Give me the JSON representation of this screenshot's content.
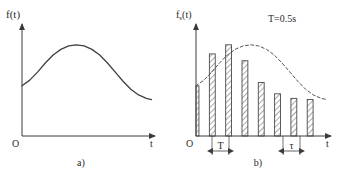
{
  "figure": {
    "background": "#ffffff",
    "stroke": "#3a3a3a",
    "hatch_color": "#555555"
  },
  "panel_a": {
    "caption": "a)",
    "y_axis_label": "f(t)",
    "x_axis_label": "t",
    "origin_label": "O",
    "axes": {
      "x0": 22,
      "y0": 136,
      "x1": 158,
      "y1": 22
    },
    "chart_data": {
      "type": "line",
      "title": "",
      "xlabel": "t",
      "ylabel": "f(t)",
      "series": [
        {
          "name": "f(t)",
          "points": [
            [
              0.0,
              0.44
            ],
            [
              0.06,
              0.49
            ],
            [
              0.12,
              0.56
            ],
            [
              0.18,
              0.64
            ],
            [
              0.24,
              0.71
            ],
            [
              0.3,
              0.76
            ],
            [
              0.36,
              0.79
            ],
            [
              0.42,
              0.8
            ],
            [
              0.48,
              0.79
            ],
            [
              0.54,
              0.76
            ],
            [
              0.6,
              0.71
            ],
            [
              0.66,
              0.64
            ],
            [
              0.72,
              0.56
            ],
            [
              0.78,
              0.48
            ],
            [
              0.84,
              0.41
            ],
            [
              0.9,
              0.36
            ],
            [
              0.96,
              0.33
            ],
            [
              1.0,
              0.32
            ]
          ]
        }
      ],
      "xlim": [
        0,
        1.05
      ],
      "ylim": [
        0,
        1
      ],
      "grid": false,
      "legend": "none"
    }
  },
  "panel_b": {
    "caption": "b)",
    "y_axis_label": "fs(t)",
    "x_axis_label": "t",
    "origin_label": "O",
    "annotation": "T=0.5s",
    "period_label": "T",
    "width_label": "τ",
    "axes": {
      "x0": 196,
      "y0": 136,
      "x1": 333,
      "y1": 22
    },
    "chart_data": {
      "type": "bar",
      "title": "",
      "xlabel": "t",
      "ylabel": "fs(t)",
      "annotation": "T=0.5s",
      "period": 0.5,
      "period_unit": "s",
      "categories": [
        "0",
        "T",
        "2T",
        "3T",
        "4T",
        "5T",
        "6T",
        "7T"
      ],
      "x": [
        0.0,
        0.125,
        0.25,
        0.375,
        0.5,
        0.625,
        0.75,
        0.875
      ],
      "values": [
        0.44,
        0.72,
        0.8,
        0.66,
        0.47,
        0.37,
        0.33,
        0.32
      ],
      "bar_width": 0.045,
      "xlim": [
        0,
        1.05
      ],
      "ylim": [
        0,
        1
      ],
      "grid": false,
      "legend": "none",
      "envelope": {
        "name": "f(t) envelope",
        "style": "dashed",
        "points": [
          [
            0.0,
            0.44
          ],
          [
            0.06,
            0.49
          ],
          [
            0.12,
            0.56
          ],
          [
            0.18,
            0.64
          ],
          [
            0.24,
            0.71
          ],
          [
            0.3,
            0.76
          ],
          [
            0.36,
            0.79
          ],
          [
            0.42,
            0.8
          ],
          [
            0.48,
            0.79
          ],
          [
            0.54,
            0.76
          ],
          [
            0.6,
            0.71
          ],
          [
            0.66,
            0.64
          ],
          [
            0.72,
            0.56
          ],
          [
            0.78,
            0.48
          ],
          [
            0.84,
            0.41
          ],
          [
            0.9,
            0.36
          ],
          [
            0.96,
            0.33
          ],
          [
            1.0,
            0.32
          ]
        ]
      }
    }
  }
}
